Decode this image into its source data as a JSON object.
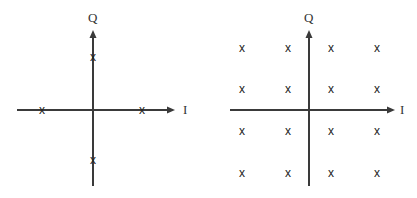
{
  "diagrams": [
    {
      "name": "qpsk-constellation",
      "origin": {
        "x": 93,
        "y": 110
      },
      "i_axis": {
        "x1": 17,
        "x2": 175,
        "label": "I",
        "label_x": 183,
        "label_y": 114
      },
      "q_axis": {
        "y1": 186,
        "y2": 30,
        "label": "Q",
        "label_x": 88,
        "label_y": 22
      },
      "marker": "x",
      "points": [
        {
          "x": 93,
          "y": 57
        },
        {
          "x": 93,
          "y": 160
        },
        {
          "x": 42,
          "y": 110
        },
        {
          "x": 142,
          "y": 110
        }
      ]
    },
    {
      "name": "16qam-constellation",
      "origin": {
        "x": 309,
        "y": 110
      },
      "i_axis": {
        "x1": 230,
        "x2": 395,
        "label": "I",
        "label_x": 400,
        "label_y": 114
      },
      "q_axis": {
        "y1": 186,
        "y2": 30,
        "label": "Q",
        "label_x": 304,
        "label_y": 22
      },
      "marker": "x",
      "points": [
        {
          "x": 242,
          "y": 48
        },
        {
          "x": 288,
          "y": 48
        },
        {
          "x": 331,
          "y": 48
        },
        {
          "x": 377,
          "y": 48
        },
        {
          "x": 242,
          "y": 89
        },
        {
          "x": 288,
          "y": 89
        },
        {
          "x": 331,
          "y": 89
        },
        {
          "x": 377,
          "y": 89
        },
        {
          "x": 242,
          "y": 131
        },
        {
          "x": 288,
          "y": 131
        },
        {
          "x": 331,
          "y": 131
        },
        {
          "x": 377,
          "y": 131
        },
        {
          "x": 242,
          "y": 173
        },
        {
          "x": 288,
          "y": 173
        },
        {
          "x": 331,
          "y": 173
        },
        {
          "x": 377,
          "y": 173
        }
      ]
    }
  ],
  "colors": {
    "axis": "#3a3a3a",
    "marker": "#222222",
    "background": "#ffffff"
  }
}
